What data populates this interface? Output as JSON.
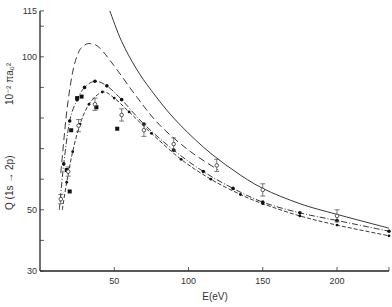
{
  "chart_data": {
    "type": "line",
    "title": "",
    "xlabel": "E(eV)",
    "ylabel": "Q (1s → 2p)",
    "ylabel_units": "10⁻² πa₀²",
    "xlim": [
      0,
      235
    ],
    "ylim": [
      30,
      115
    ],
    "x_ticks": [
      50,
      100,
      150,
      200
    ],
    "x_tick_labels": [
      "50",
      "100",
      "150",
      "200"
    ],
    "y_ticks": [
      30,
      40,
      50,
      60,
      70,
      80,
      90,
      100,
      110,
      115
    ],
    "y_tick_labels": [
      {
        "v": 30,
        "label": "30"
      },
      {
        "v": 50,
        "label": "50"
      },
      {
        "v": 100,
        "label": "100"
      },
      {
        "v": 115,
        "label": "115"
      }
    ],
    "grid": false,
    "legend": null,
    "series": [
      {
        "name": "solid-theory",
        "style": "solid",
        "x": [
          47,
          55,
          65,
          75,
          90,
          110,
          130,
          150,
          175,
          200,
          235
        ],
        "y": [
          115,
          105,
          96,
          89,
          80,
          70.5,
          63,
          57,
          52,
          48.5,
          44
        ]
      },
      {
        "name": "long-dash-theory",
        "style": "longdash",
        "x": [
          14,
          18,
          22,
          26,
          30,
          34,
          40,
          50,
          65,
          80,
          100,
          120
        ],
        "y": [
          62,
          82,
          95,
          101.5,
          103.8,
          104.3,
          103,
          97,
          87,
          78,
          69.5,
          63
        ]
      },
      {
        "name": "dash-dot-with-points",
        "style": "dashdot",
        "markers": "filled-circle",
        "x": [
          13,
          16,
          20,
          25,
          30,
          37,
          45,
          55,
          70,
          90,
          110,
          130,
          150,
          175,
          200,
          235
        ],
        "y": [
          50,
          65,
          79,
          86,
          90,
          92,
          90.5,
          86,
          78,
          69.5,
          62.5,
          57,
          52.5,
          49,
          46.5,
          43
        ]
      },
      {
        "name": "dash-with-points",
        "style": "dash",
        "markers": "small-circle",
        "x": [
          15,
          18,
          22,
          27,
          33,
          42,
          50,
          60,
          75,
          95,
          115,
          135,
          150,
          175,
          200,
          235
        ],
        "y": [
          50,
          59,
          69,
          78,
          84.5,
          88.5,
          86.5,
          82,
          75,
          66.5,
          60,
          55,
          52,
          48,
          45,
          41.5
        ]
      }
    ],
    "experimental_points": {
      "filled_squares": [
        {
          "x": 21,
          "y": 76
        },
        {
          "x": 25,
          "y": 86.5
        },
        {
          "x": 28,
          "y": 87
        },
        {
          "x": 18,
          "y": 63
        },
        {
          "x": 20,
          "y": 56
        },
        {
          "x": 38,
          "y": 83.5
        },
        {
          "x": 52,
          "y": 76.5
        }
      ],
      "open_circles_errorbars": [
        {
          "x": 14,
          "y": 53.5,
          "err": 1.5
        },
        {
          "x": 19,
          "y": 62.5,
          "err": 1.5
        },
        {
          "x": 26,
          "y": 77.5,
          "err": 2
        },
        {
          "x": 37,
          "y": 84.5,
          "err": 2
        },
        {
          "x": 55,
          "y": 81,
          "err": 2
        },
        {
          "x": 70,
          "y": 76,
          "err": 2
        },
        {
          "x": 90,
          "y": 71.5,
          "err": 2
        },
        {
          "x": 119,
          "y": 64.5,
          "err": 2
        },
        {
          "x": 150,
          "y": 56.5,
          "err": 2
        },
        {
          "x": 200,
          "y": 48,
          "err": 2
        }
      ]
    }
  }
}
